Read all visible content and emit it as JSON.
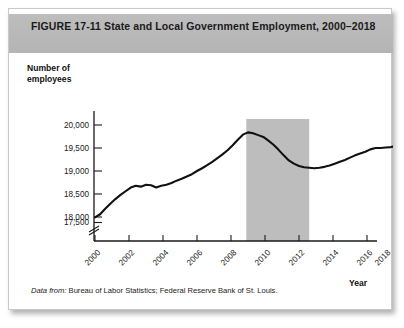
{
  "figure": {
    "label": "FIGURE  17-11",
    "title": "State and Local Government Employment, 2000–2018",
    "full_header": "FIGURE  17-11   State and Local Government Employment, 2000–2018",
    "source_lead": "Data from:",
    "source_text": " Bureau of Labor Statistics; Federal Reserve Bank of St. Louis.",
    "header_bg": "#b8b8b8",
    "card_bg": "#ffffff",
    "line_color": "#111111",
    "recession_band_color": "#bdbdbd"
  },
  "chart_data": {
    "type": "line",
    "title": "State and Local Government Employment, 2000–2018",
    "xlabel": "Year",
    "ylabel": "Number of employees",
    "ylabel_lines": [
      "Number of",
      "employees"
    ],
    "xlim": [
      2000,
      2018.6
    ],
    "ylim": [
      17400,
      20100
    ],
    "y_axis_break": true,
    "grid": false,
    "legend": null,
    "ytick_labels": [
      "20,000",
      "19,500",
      "19,000",
      "18,500",
      "18,000",
      "17,500"
    ],
    "ytick_values": [
      20000,
      19500,
      19000,
      18500,
      18000,
      17500
    ],
    "xtick_labels": [
      "2000",
      "2002",
      "2004",
      "2006",
      "2008",
      "2010",
      "2012",
      "2014",
      "2016",
      "2018"
    ],
    "xtick_values": [
      2000,
      2002,
      2004,
      2006,
      2008,
      2010,
      2012,
      2014,
      2016,
      2018
    ],
    "annotations": [
      {
        "name": "recession-band",
        "type": "vertical-shaded-region",
        "x_start": 2008.9,
        "x_end": 2012.6,
        "color": "#bdbdbd"
      }
    ],
    "series": [
      {
        "name": "State and local government employment (thousands)",
        "x": [
          2000.0,
          2000.3,
          2000.6,
          2000.9,
          2001.2,
          2001.5,
          2001.8,
          2002.1,
          2002.4,
          2002.7,
          2003.0,
          2003.3,
          2003.6,
          2003.9,
          2004.2,
          2004.5,
          2004.8,
          2005.1,
          2005.4,
          2005.7,
          2006.0,
          2006.3,
          2006.6,
          2006.9,
          2007.2,
          2007.5,
          2007.8,
          2008.1,
          2008.4,
          2008.7,
          2009.0,
          2009.3,
          2009.6,
          2009.9,
          2010.2,
          2010.5,
          2010.8,
          2011.1,
          2011.4,
          2011.7,
          2012.0,
          2012.3,
          2012.6,
          2012.9,
          2013.2,
          2013.5,
          2013.8,
          2014.1,
          2014.4,
          2014.7,
          2015.0,
          2015.3,
          2015.6,
          2015.9,
          2016.2,
          2016.5,
          2016.8,
          2017.1,
          2017.4,
          2017.7,
          2018.0,
          2018.3
        ],
        "y": [
          17990,
          18060,
          18180,
          18290,
          18390,
          18480,
          18560,
          18640,
          18680,
          18660,
          18700,
          18690,
          18640,
          18680,
          18700,
          18740,
          18790,
          18830,
          18880,
          18930,
          19000,
          19060,
          19130,
          19200,
          19280,
          19360,
          19450,
          19560,
          19680,
          19790,
          19840,
          19820,
          19780,
          19740,
          19660,
          19570,
          19460,
          19340,
          19230,
          19160,
          19110,
          19080,
          19070,
          19060,
          19070,
          19090,
          19120,
          19160,
          19200,
          19240,
          19290,
          19340,
          19380,
          19420,
          19470,
          19500,
          19500,
          19510,
          19520,
          19540,
          19550,
          19560
        ],
        "units": "thousands of employees",
        "start_value": 17990,
        "peak_value": 19840,
        "peak_year": 2009.0,
        "trough_value": 19060,
        "trough_year": 2012.9,
        "end_value": 19560
      }
    ]
  }
}
